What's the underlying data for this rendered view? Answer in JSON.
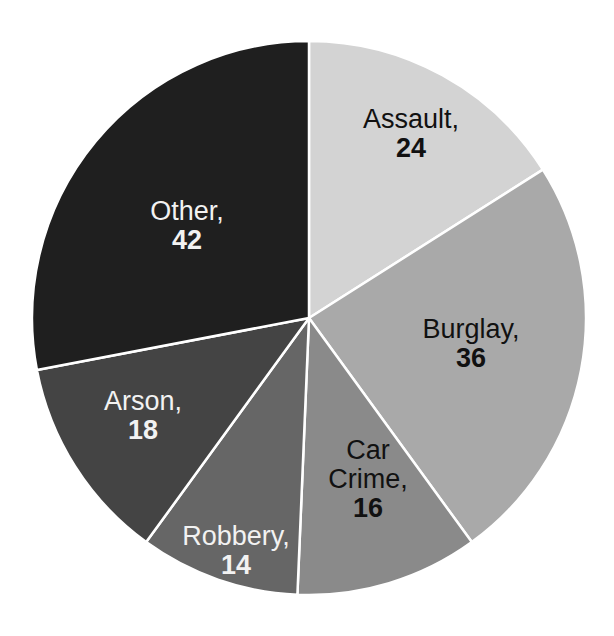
{
  "chart_data": {
    "type": "pie",
    "title": "",
    "start_angle_deg": 0,
    "direction": "clockwise",
    "categories": [
      "Assault",
      "Burglay",
      "Car Crime",
      "Robbery",
      "Arson",
      "Other"
    ],
    "values": [
      24,
      36,
      16,
      14,
      18,
      42
    ],
    "slices": [
      {
        "name": "Assault",
        "value": 24,
        "label_name": "Assault,",
        "label_value": "24",
        "color": "#d3d3d3",
        "text_color": "#111111",
        "label_pos": [
          411,
          134
        ]
      },
      {
        "name": "Burglay",
        "value": 36,
        "label_name": "Burglay,",
        "label_value": "36",
        "color": "#a9a9a9",
        "text_color": "#111111",
        "label_pos": [
          471,
          344
        ]
      },
      {
        "name": "Car Crime",
        "value": 16,
        "label_name": "Car Crime,",
        "label_value": "16",
        "color": "#8a8a8a",
        "text_color": "#111111",
        "label_pos": [
          368,
          480
        ]
      },
      {
        "name": "Robbery",
        "value": 14,
        "label_name": "Robbery,",
        "label_value": "14",
        "color": "#666666",
        "text_color": "#f2f2f2",
        "label_pos": [
          236,
          551
        ]
      },
      {
        "name": "Arson",
        "value": 18,
        "label_name": "Arson,",
        "label_value": "18",
        "color": "#444444",
        "text_color": "#f2f2f2",
        "label_pos": [
          143,
          416
        ]
      },
      {
        "name": "Other",
        "value": 42,
        "label_name": "Other,",
        "label_value": "42",
        "color": "#1f1f1f",
        "text_color": "#f2f2f2",
        "label_pos": [
          187,
          226
        ]
      }
    ],
    "total": 150,
    "legend": "none",
    "geometry": {
      "cx": 309,
      "cy": 318,
      "r": 277
    },
    "separator_color": "#ffffff"
  }
}
